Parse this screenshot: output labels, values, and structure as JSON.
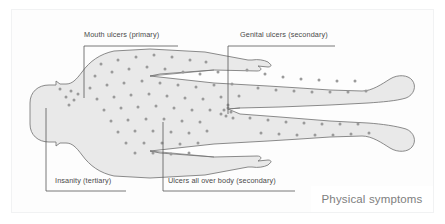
{
  "figure": {
    "caption": "Physical symptoms",
    "colors": {
      "page_background": "#ffffff",
      "frame_border": "#f1f2f3",
      "body_fill": "#e9e9e9",
      "body_outline": "#6f6f6f",
      "spot": "#9a9a9a",
      "leader_line": "#555555",
      "label_text": "#4a4a4a",
      "caption_text": "#7e7e7e"
    }
  },
  "callouts": [
    {
      "id": "mouth-ulcers",
      "label": "Mouth ulcers (primary)",
      "stage": "primary",
      "target": "mouth",
      "position": "top-left"
    },
    {
      "id": "genital-ulcers",
      "label": "Genital ulcers (secondary)",
      "stage": "secondary",
      "target": "groin",
      "position": "top-right"
    },
    {
      "id": "insanity",
      "label": "Insanity (tertiary)",
      "stage": "tertiary",
      "target": "head",
      "position": "bottom-left"
    },
    {
      "id": "ulcers-all-over-body",
      "label": "Ulcers all over body (secondary)",
      "stage": "secondary",
      "target": "torso",
      "position": "bottom-center"
    }
  ]
}
